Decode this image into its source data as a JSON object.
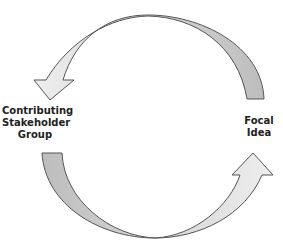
{
  "diagram": {
    "type": "cycle",
    "nodes": [
      {
        "id": "stakeholder",
        "label_lines": [
          "Contributing",
          "Stakeholder",
          "Group"
        ]
      },
      {
        "id": "focal",
        "label_lines": [
          "Focal",
          "Idea"
        ]
      }
    ],
    "edges": [
      {
        "from": "focal",
        "to": "stakeholder",
        "style": "curved-arrow-top"
      },
      {
        "from": "stakeholder",
        "to": "focal",
        "style": "curved-arrow-bottom"
      }
    ],
    "colors": {
      "arrow_fill": "#c9c9c9",
      "arrow_fill_light": "#e6e6e6",
      "arrow_stroke": "#555555",
      "text": "#222222"
    }
  },
  "labels": {
    "left": [
      "Contributing",
      "Stakeholder",
      "Group"
    ],
    "right": [
      "Focal",
      "Idea"
    ]
  }
}
